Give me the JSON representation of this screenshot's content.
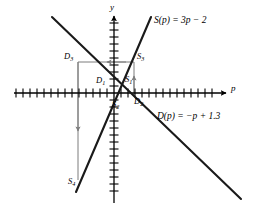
{
  "figure": {
    "kind": "cobweb-supply-demand-diagram",
    "axes": {
      "x_label": "p",
      "y_label": "y",
      "x_axis_name": "price-axis",
      "y_axis_name": "quantity-axis",
      "origin_px": [
        114,
        93
      ],
      "x_tick_spacing_px": 7,
      "y_tick_spacing_px": 7,
      "x_tick_count_left": 14,
      "x_tick_count_right": 15,
      "y_tick_count_up": 10,
      "y_tick_count_down": 15,
      "grid": false
    },
    "equations": {
      "supply": {
        "label_html": "S(p) = 3p − 2",
        "name": "supply-function-label",
        "slope": 3,
        "intercept": -2,
        "x_px": 172,
        "y_px": 22
      },
      "demand": {
        "label_html": "D(p) = −p + 1.3",
        "name": "demand-function-label",
        "slope": -1,
        "intercept": 1.3,
        "x_px": 163,
        "y_px": 118
      }
    },
    "lines": {
      "supply": {
        "x1": 151,
        "y1": 17,
        "x2": 76,
        "y2": 192,
        "name": "supply-line",
        "color": "#1a1a1a",
        "width": 2.1
      },
      "demand": {
        "x1": 52,
        "y1": 17,
        "x2": 241,
        "y2": 199,
        "name": "demand-line",
        "color": "#1a1a1a",
        "width": 2.1
      }
    },
    "points": [
      {
        "id": "D1",
        "base": "D",
        "sub": "1",
        "name": "point-label-d1",
        "x_px": 99,
        "y_px": 81
      },
      {
        "id": "S1",
        "base": "S",
        "sub": "1",
        "name": "point-label-s1",
        "x_px": 126,
        "y_px": 80
      },
      {
        "id": "D2",
        "base": "D",
        "sub": "2",
        "name": "point-label-d2",
        "x_px": 135,
        "y_px": 101
      },
      {
        "id": "S2",
        "base": "S",
        "sub": "2",
        "name": "point-label-s2",
        "x_px": 113,
        "y_px": 104
      },
      {
        "id": "D3",
        "base": "D",
        "sub": "3",
        "name": "point-label-d3",
        "x_px": 69,
        "y_px": 56
      },
      {
        "id": "S3",
        "base": "S",
        "sub": "3",
        "name": "point-label-s3",
        "x_px": 138,
        "y_px": 56
      },
      {
        "id": "S4",
        "base": "S",
        "sub": "4",
        "name": "point-label-s4",
        "x_px": 74,
        "y_px": 181
      }
    ],
    "construction": {
      "color": "#7d7d7d",
      "width": 1.0,
      "segments": [
        {
          "name": "cobweb-vertical-s3-to-s1",
          "x1": 134,
          "y1": 96,
          "x2": 134,
          "y2": 62,
          "arrow": "up"
        },
        {
          "name": "cobweb-horizontal-s3-to-axis",
          "x1": 134,
          "y1": 62,
          "x2": 108,
          "y2": 62,
          "arrow": "left"
        },
        {
          "name": "cobweb-horizontal-d3-row",
          "x1": 108,
          "y1": 62,
          "x2": 78,
          "y2": 62,
          "arrow": "none"
        },
        {
          "name": "cobweb-vertical-d3-to-s4",
          "x1": 78,
          "y1": 62,
          "x2": 78,
          "y2": 180,
          "arrow": "down"
        },
        {
          "name": "cobweb-vertical-d2-short",
          "x1": 134,
          "y1": 96,
          "x2": 134,
          "y2": 86,
          "arrow": "none"
        }
      ]
    },
    "colors": {
      "curve": "#1a1a1a",
      "axis": "#000000",
      "construction": "#7d7d7d",
      "background": "#ffffff"
    }
  }
}
